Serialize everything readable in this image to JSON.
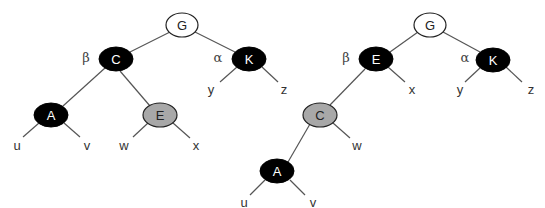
{
  "diagram": {
    "type": "tree-rotation",
    "colors": {
      "black_node": "#000000",
      "white_node": "#ffffff",
      "gray_node": "#a8a8a8",
      "edge": "#555555"
    },
    "left_tree": {
      "nodes": {
        "G": {
          "label": "G",
          "color": "white"
        },
        "C": {
          "label": "C",
          "color": "black",
          "tag": "β"
        },
        "K": {
          "label": "K",
          "color": "black",
          "tag": "α"
        },
        "A": {
          "label": "A",
          "color": "black"
        },
        "E": {
          "label": "E",
          "color": "gray"
        }
      },
      "leaves": {
        "u": "u",
        "v": "v",
        "w": "w",
        "x": "x",
        "y": "y",
        "z": "z"
      },
      "edges": [
        [
          "G",
          "C"
        ],
        [
          "G",
          "K"
        ],
        [
          "C",
          "A"
        ],
        [
          "C",
          "E"
        ],
        [
          "A",
          "u"
        ],
        [
          "A",
          "v"
        ],
        [
          "E",
          "w"
        ],
        [
          "E",
          "x"
        ],
        [
          "K",
          "y"
        ],
        [
          "K",
          "z"
        ]
      ]
    },
    "right_tree": {
      "nodes": {
        "G": {
          "label": "G",
          "color": "white"
        },
        "E": {
          "label": "E",
          "color": "black",
          "tag": "β"
        },
        "K": {
          "label": "K",
          "color": "black",
          "tag": "α"
        },
        "C": {
          "label": "C",
          "color": "gray"
        },
        "A": {
          "label": "A",
          "color": "black"
        }
      },
      "leaves": {
        "x": "x",
        "y": "y",
        "z": "z",
        "w": "w",
        "u": "u",
        "v": "v"
      },
      "edges": [
        [
          "G",
          "E"
        ],
        [
          "G",
          "K"
        ],
        [
          "E",
          "C"
        ],
        [
          "E",
          "x"
        ],
        [
          "K",
          "y"
        ],
        [
          "K",
          "z"
        ],
        [
          "C",
          "A"
        ],
        [
          "C",
          "w"
        ],
        [
          "A",
          "u"
        ],
        [
          "A",
          "v"
        ]
      ]
    }
  }
}
